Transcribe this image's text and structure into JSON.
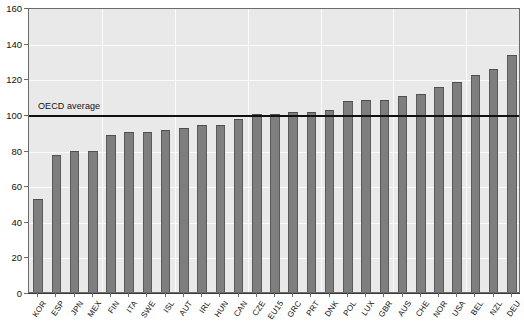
{
  "chart_data": {
    "type": "bar",
    "title": "",
    "subtitle": "",
    "xlabel": "",
    "ylabel": "",
    "ylim": [
      0,
      160
    ],
    "yticks": [
      0,
      20,
      40,
      60,
      80,
      100,
      120,
      140,
      160
    ],
    "grid": true,
    "legend": "none",
    "categories": [
      "KOR",
      "ESP",
      "JPN",
      "MEX",
      "FIN",
      "ITA",
      "SWE",
      "ISL",
      "AUT",
      "IRL",
      "HUN",
      "CAN",
      "CZE",
      "EU15",
      "GRC",
      "PRT",
      "DNK",
      "POL",
      "LUX",
      "GBR",
      "AUS",
      "CHE",
      "NOR",
      "USA",
      "BEL",
      "NZL",
      "DEU"
    ],
    "values": [
      52,
      77,
      79,
      79,
      88,
      90,
      90,
      91,
      92,
      94,
      94,
      97,
      100,
      100,
      101,
      101,
      102,
      107,
      108,
      108,
      110,
      111,
      115,
      118,
      122,
      125,
      133
    ],
    "annotations": [
      {
        "name": "oecd-average-line",
        "label": "OECD average",
        "value": 100,
        "type": "hline"
      }
    ],
    "bar_color": "#7e7e7e",
    "plot_background": "#e9e9e9",
    "annotation_color": "#111111"
  },
  "axes": {
    "y_tick_labels": [
      "160",
      "140",
      "120",
      "100",
      "80",
      "60",
      "40",
      "20",
      "0"
    ]
  }
}
